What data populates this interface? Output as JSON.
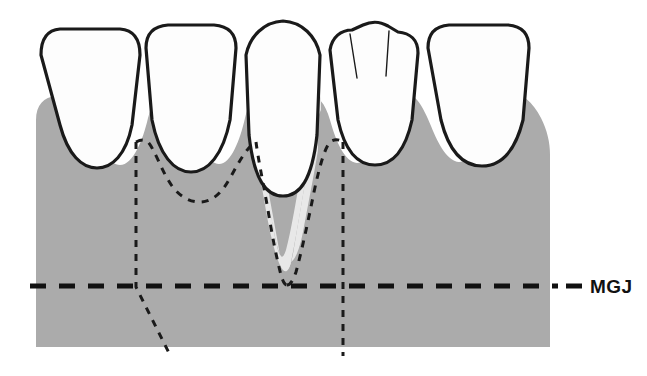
{
  "figure": {
    "type": "dental-anatomy-illustration"
  },
  "labels": {
    "mgj": "MGJ"
  },
  "colors": {
    "background": "#ffffff",
    "gingiva": "#ababab",
    "recession_defect": "#e8e8e8",
    "tooth_fill": "#fdfdfd",
    "outline": "#1a1a1a",
    "dashed_incision": "#1a1a1a"
  },
  "teeth": [
    {
      "id": "tooth-1",
      "name": "lateral-incisor-left",
      "crown_shape": "squared-incisal-edge",
      "outline": "M 41,55 C 41,38 48,30 60,29 L 120,29 C 133,30 140,38 140,55 L 132,125 C 126,155 112,168 97,168 C 82,168 68,155 60,125 Z",
      "has_mamelons": false
    },
    {
      "id": "tooth-2",
      "name": "central-incisor-left",
      "crown_shape": "squared-incisal-edge",
      "outline": "M 146,48 C 146,33 154,26 168,25 L 214,25 C 228,26 236,33 236,48 L 230,120 C 223,155 208,172 191,172 C 174,172 159,155 152,120 Z",
      "has_mamelons": false
    },
    {
      "id": "tooth-3",
      "name": "central-incisor-right-recessed",
      "crown_shape": "domed-pointed-incisal-edge",
      "outline": "M 246,55 C 250,36 264,22 283,21 C 302,22 316,36 320,55 L 317,135 C 312,180 300,196 283,196 C 266,196 254,180 249,135 Z",
      "has_mamelons": false,
      "note": "root exposed by recession"
    },
    {
      "id": "tooth-4",
      "name": "lateral-incisor-right",
      "crown_shape": "scalloped-mamelon-incisal-edge",
      "outline": "M 330,50 C 332,37 341,30 352,30 L 363,25 C 372,21 379,21 388,26 L 398,32 C 410,33 418,40 418,53 L 412,120 C 405,152 392,165 375,165 C 358,165 345,152 338,120 Z",
      "has_mamelons": true,
      "mamelon_lines": [
        "M 350,34 L 357,78",
        "M 389,31 L 386,76"
      ]
    },
    {
      "id": "tooth-5",
      "name": "canine-right",
      "crown_shape": "squared-incisal-edge",
      "outline": "M 428,48 C 428,33 436,26 449,25 L 508,25 C 521,26 529,33 529,48 L 523,120 C 515,152 500,166 482,166 C 464,166 449,152 441,120 Z",
      "has_mamelons": false
    }
  ],
  "gingiva": {
    "id": "gingival-tissue",
    "name": "attached-gingiva-and-alveolar-mucosa",
    "outline": "M 36,120 C 36,105 44,97 56,96 C 72,96 84,110 92,130 C 100,150 110,165 120,165 C 133,165 143,140 148,118 C 152,102 158,96 166,96 C 176,96 184,108 192,128 C 200,148 208,163 219,164 C 231,164 240,140 245,118 C 249,101 255,95 263,95 C 272,95 279,106 285,124 L 285,265 L 285,124 C 291,106 299,95 309,95 C 318,95 325,103 330,120 C 336,142 345,162 357,163 C 369,163 378,140 384,118 C 389,100 396,93 405,93 C 415,93 423,106 431,126 C 439,146 448,161 459,162 C 472,162 482,138 488,116 C 493,98 500,92 509,92 C 521,92 533,102 541,118 C 547,130 550,142 550,155 L 550,347 L 36,347 Z",
    "bottom_y": 347,
    "left_x": 36,
    "right_x": 550
  },
  "recession_defect": {
    "id": "recession-defect",
    "name": "gingival-recession-defect",
    "outline": "M 252,113 C 256,130 261,152 266,178 C 271,205 276,232 280,255 C 282,265 284,270 286,270 C 289,270 291,264 293,254 C 297,230 302,200 307,172 C 311,148 315,128 318,112 L 318,150 C 314,175 308,205 303,232 C 299,252 294,263 288,263 C 282,263 278,252 274,232 C 269,205 262,172 256,145 Z",
    "description": "light-gray wedge of exposed root / defect extending apically to the MGJ"
  },
  "incision_outline": {
    "id": "dashed-incision-lines",
    "name": "proposed-flap-incision-outline",
    "stroke_dasharray": "7 7",
    "stroke_width": 3,
    "paths": [
      {
        "name": "scallop-outline-tooth1-tooth2",
        "d": "M 136,142 C 140,140 144,139 148,142 C 155,150 162,172 172,186 C 180,197 190,202 200,202 C 212,202 222,193 230,178 C 240,160 248,146 256,142"
      },
      {
        "name": "defect-outline-left-limb",
        "d": "M 256,142 C 258,158 263,182 268,210 C 272,235 277,260 281,275 C 283,282 285,285 287,285"
      },
      {
        "name": "defect-outline-right-limb",
        "d": "M 287,285 C 290,285 293,281 296,272 C 301,254 308,222 314,192 C 320,164 325,148 330,142 C 334,139 339,139 343,142"
      },
      {
        "name": "vertical-releasing-incision-left",
        "d": "M 136,142 L 136,287 L 170,355"
      },
      {
        "name": "vertical-releasing-incision-right",
        "d": "M 343,142 L 343,356"
      }
    ]
  },
  "mgj_line": {
    "id": "mgj-reference-line",
    "name": "mucogingival-junction-line",
    "y": 286,
    "x_start": 30,
    "x_end": 558,
    "stroke_width": 5,
    "stroke_dasharray": "16 13",
    "label_dash": {
      "x_start": 566,
      "x_end": 582
    },
    "label_x": 590,
    "label_y": 293
  }
}
